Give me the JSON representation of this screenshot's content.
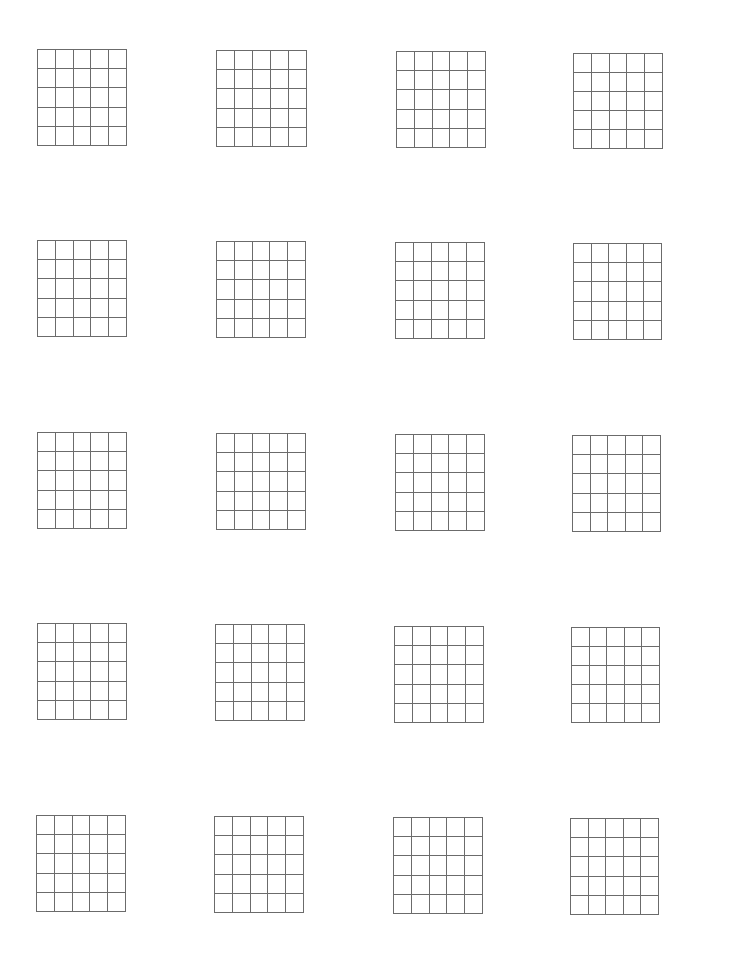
{
  "worksheet": {
    "rows": 5,
    "columns": 4,
    "grid_rows": 5,
    "grid_cols": 5,
    "line_color": "#6b6b6b",
    "background": "#ffffff",
    "grids": [
      {
        "x": 37,
        "y": 49,
        "w": 90,
        "h": 97
      },
      {
        "x": 216,
        "y": 50,
        "w": 91,
        "h": 97
      },
      {
        "x": 396,
        "y": 51,
        "w": 90,
        "h": 97
      },
      {
        "x": 573,
        "y": 53,
        "w": 90,
        "h": 96
      },
      {
        "x": 37,
        "y": 240,
        "w": 90,
        "h": 97
      },
      {
        "x": 216,
        "y": 241,
        "w": 90,
        "h": 97
      },
      {
        "x": 395,
        "y": 242,
        "w": 90,
        "h": 97
      },
      {
        "x": 573,
        "y": 243,
        "w": 89,
        "h": 97
      },
      {
        "x": 37,
        "y": 432,
        "w": 90,
        "h": 97
      },
      {
        "x": 216,
        "y": 433,
        "w": 90,
        "h": 97
      },
      {
        "x": 395,
        "y": 434,
        "w": 90,
        "h": 97
      },
      {
        "x": 572,
        "y": 435,
        "w": 89,
        "h": 97
      },
      {
        "x": 37,
        "y": 623,
        "w": 90,
        "h": 97
      },
      {
        "x": 215,
        "y": 624,
        "w": 90,
        "h": 97
      },
      {
        "x": 394,
        "y": 626,
        "w": 90,
        "h": 97
      },
      {
        "x": 571,
        "y": 627,
        "w": 89,
        "h": 96
      },
      {
        "x": 36,
        "y": 815,
        "w": 90,
        "h": 97
      },
      {
        "x": 214,
        "y": 816,
        "w": 90,
        "h": 97
      },
      {
        "x": 393,
        "y": 817,
        "w": 90,
        "h": 97
      },
      {
        "x": 570,
        "y": 818,
        "w": 89,
        "h": 97
      }
    ]
  }
}
